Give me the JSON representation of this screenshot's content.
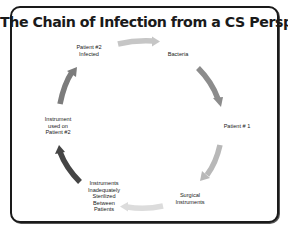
{
  "title": "The Chain of Infection from a CS Perspective",
  "cycle": {
    "nodes": [
      {
        "id": "bacteria",
        "lines": [
          "Bacteria"
        ]
      },
      {
        "id": "patient-1",
        "lines": [
          "Patient # 1"
        ]
      },
      {
        "id": "surgical-instruments",
        "lines": [
          "Surgical",
          "Instruments"
        ]
      },
      {
        "id": "instruments-inadequately-sterilized",
        "lines": [
          "Instruments",
          "Inadequately",
          "Sterilized",
          "Between",
          "Patients"
        ]
      },
      {
        "id": "instrument-used-on-patient-2",
        "lines": [
          "Instrument",
          "used on",
          "Patient #2"
        ]
      },
      {
        "id": "patient-2-infected",
        "lines": [
          "Patient #2",
          "Infected"
        ]
      }
    ],
    "arrows": [
      {
        "from": "patient-2-infected",
        "to": "bacteria",
        "color": "#c6c6c6"
      },
      {
        "from": "bacteria",
        "to": "patient-1",
        "color": "#8c8c8c"
      },
      {
        "from": "patient-1",
        "to": "surgical-instruments",
        "color": "#b8b8b8"
      },
      {
        "from": "surgical-instruments",
        "to": "instruments-inadequately-sterilized",
        "color": "#dcdcdc"
      },
      {
        "from": "instruments-inadequately-sterilized",
        "to": "instrument-used-on-patient-2",
        "color": "#454545"
      },
      {
        "from": "instrument-used-on-patient-2",
        "to": "patient-2-infected",
        "color": "#7c7c7c"
      }
    ]
  }
}
